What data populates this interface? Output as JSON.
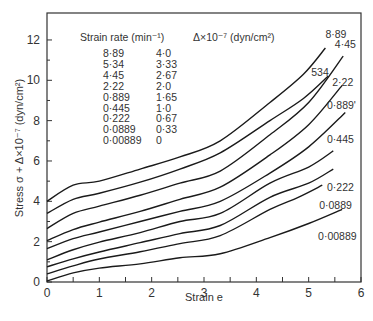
{
  "chart_data": {
    "type": "line",
    "title": "",
    "xlabel": "Strain e",
    "ylabel": "Stress σ + Δ×10⁻⁷ (dyn/cm²)",
    "xlim": [
      0,
      6
    ],
    "ylim": [
      0,
      13
    ],
    "x_ticks": [
      0,
      1,
      2,
      3,
      4,
      5,
      6
    ],
    "y_ticks": [
      0,
      2,
      4,
      6,
      8,
      10,
      12
    ],
    "grid": false,
    "legend": {
      "position": "upper-left",
      "header_col1": "Strain rate (min⁻¹)",
      "header_col2": "Δ×10⁻⁷ (dyn/cm²)",
      "rows": [
        {
          "rate": "8·89",
          "delta": "4·0"
        },
        {
          "rate": "5·34",
          "delta": "3·33"
        },
        {
          "rate": "4·45",
          "delta": "2·67"
        },
        {
          "rate": "2·22",
          "delta": "2·0"
        },
        {
          "rate": "0·889",
          "delta": "1·65"
        },
        {
          "rate": "0·445",
          "delta": "1·0"
        },
        {
          "rate": "0·222",
          "delta": "0·67"
        },
        {
          "rate": "0·0889",
          "delta": "0·33"
        },
        {
          "rate": "0·00889",
          "delta": "0"
        }
      ]
    },
    "series": [
      {
        "name": "8·89",
        "label": "8·89",
        "x": [
          0,
          0.5,
          1.0,
          1.78,
          2.54,
          3.31,
          4.26,
          4.9,
          5.32
        ],
        "y": [
          4.0,
          4.8,
          5.0,
          5.6,
          6.2,
          7.0,
          8.9,
          10.3,
          11.6
        ]
      },
      {
        "name": "5·34",
        "label": "534",
        "x": [
          0,
          0.5,
          1.0,
          1.78,
          2.54,
          3.31,
          4.26,
          4.9,
          5.37
        ],
        "y": [
          3.4,
          4.1,
          4.4,
          4.95,
          5.6,
          6.4,
          8.0,
          9.1,
          10.2
        ]
      },
      {
        "name": "4·45",
        "label": "4·45",
        "x": [
          0,
          0.5,
          1.0,
          1.78,
          2.54,
          3.31,
          4.26,
          5.0,
          5.66
        ],
        "y": [
          2.65,
          3.4,
          3.76,
          4.3,
          4.9,
          5.5,
          7.3,
          8.9,
          11.2
        ]
      },
      {
        "name": "2·22",
        "label": "2·22",
        "x": [
          0,
          0.5,
          1.0,
          1.78,
          2.54,
          3.31,
          4.26,
          5.0,
          5.64
        ],
        "y": [
          2.05,
          2.6,
          2.97,
          3.5,
          4.1,
          4.7,
          6.3,
          7.8,
          9.75
        ]
      },
      {
        "name": "0·889",
        "label": "0·889'",
        "x": [
          0,
          0.5,
          1.0,
          1.78,
          2.54,
          3.31,
          4.26,
          5.0,
          5.7
        ],
        "y": [
          1.65,
          2.15,
          2.48,
          3.0,
          3.5,
          4.0,
          5.4,
          6.7,
          8.4
        ]
      },
      {
        "name": "0·445",
        "label": "0·445",
        "x": [
          0,
          0.5,
          1.0,
          1.78,
          2.54,
          3.31,
          4.26,
          5.0,
          5.47
        ],
        "y": [
          1.1,
          1.6,
          1.98,
          2.45,
          3.0,
          3.4,
          4.9,
          5.7,
          6.5
        ]
      },
      {
        "name": "0·222",
        "label": "0·222",
        "x": [
          0,
          0.5,
          1.0,
          1.78,
          2.54,
          3.31,
          4.26,
          5.0,
          5.47
        ],
        "y": [
          0.75,
          1.15,
          1.49,
          1.95,
          2.4,
          2.8,
          4.2,
          4.9,
          5.6
        ]
      },
      {
        "name": "0·0889",
        "label": "0·0889",
        "x": [
          0,
          0.5,
          1.0,
          1.78,
          2.54,
          3.31,
          4.26,
          4.8,
          5.26
        ],
        "y": [
          0.4,
          0.8,
          1.14,
          1.5,
          1.9,
          2.3,
          3.6,
          4.2,
          4.8
        ]
      },
      {
        "name": "0·00889",
        "label": "0·00889",
        "x": [
          0,
          0.5,
          1.0,
          1.78,
          2.54,
          3.31,
          4.26,
          5.0,
          5.64
        ],
        "y": [
          0.05,
          0.45,
          0.69,
          0.9,
          1.2,
          1.4,
          2.2,
          2.9,
          3.6
        ]
      }
    ],
    "curve_label_positions": [
      {
        "label": "8·89",
        "x": 5.32,
        "y": 12.1
      },
      {
        "label": "534",
        "x": 5.05,
        "y": 10.2
      },
      {
        "label": "4·45",
        "x": 5.5,
        "y": 11.6
      },
      {
        "label": "2·22",
        "x": 5.45,
        "y": 9.7
      },
      {
        "label": "0·889'",
        "x": 5.35,
        "y": 8.6
      },
      {
        "label": "0·445",
        "x": 5.35,
        "y": 6.9
      },
      {
        "label": "0·222",
        "x": 5.35,
        "y": 4.5
      },
      {
        "label": "0·0889",
        "x": 5.2,
        "y": 3.6
      },
      {
        "label": "0·00889",
        "x": 5.18,
        "y": 2.1
      }
    ]
  }
}
